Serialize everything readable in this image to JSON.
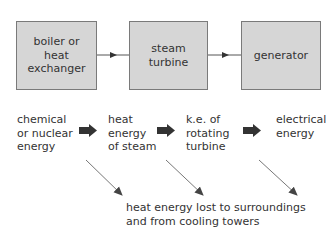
{
  "diagram": {
    "boxes": [
      {
        "label": "boiler or\nheat\nexchanger"
      },
      {
        "label": "steam\nturbine"
      },
      {
        "label": "generator"
      }
    ],
    "energy_stages": [
      {
        "label": "chemical\nor nuclear\nenergy"
      },
      {
        "label": "heat\nenergy\nof steam"
      },
      {
        "label": "k.e. of\nrotating\nturbine"
      },
      {
        "label": "electrical\nenergy"
      }
    ],
    "loss_label": "heat energy lost to surroundings\nand from cooling towers",
    "colors": {
      "box_fill": "#d6d6d6",
      "box_border": "#7a7a7a",
      "arrow": "#333333",
      "loss_arrow": "#777777"
    }
  }
}
